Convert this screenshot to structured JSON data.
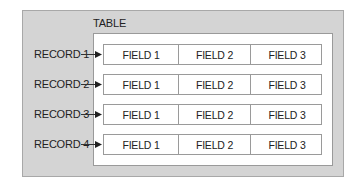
{
  "diagram": {
    "title": "TABLE",
    "records": [
      {
        "label": "RECORD 1",
        "fields": [
          "FIELD 1",
          "FIELD 2",
          "FIELD 3"
        ]
      },
      {
        "label": "RECORD 2",
        "fields": [
          "FIELD 1",
          "FIELD 2",
          "FIELD 3"
        ]
      },
      {
        "label": "RECORD 3",
        "fields": [
          "FIELD 1",
          "FIELD 2",
          "FIELD 3"
        ]
      },
      {
        "label": "RECORD 4",
        "fields": [
          "FIELD 1",
          "FIELD 2",
          "FIELD 3"
        ]
      }
    ],
    "colors": {
      "outer_bg": "#d4d4d4",
      "inner_bg": "#ffffff",
      "border": "#9a9a9a",
      "text": "#222222"
    }
  }
}
